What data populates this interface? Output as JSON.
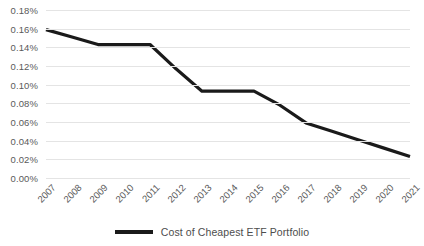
{
  "chart_data": {
    "type": "line",
    "title": "",
    "xlabel": "",
    "ylabel": "",
    "grid": true,
    "legend_position": "bottom",
    "categories": [
      "2007",
      "2008",
      "2009",
      "2010",
      "2011",
      "2012",
      "2013",
      "2014",
      "2015",
      "2016",
      "2017",
      "2018",
      "2019",
      "2020",
      "2021"
    ],
    "ylim": [
      0.0,
      0.18
    ],
    "ytick_labels": [
      "0.18%",
      "0.16%",
      "0.14%",
      "0.12%",
      "0.10%",
      "0.08%",
      "0.06%",
      "0.04%",
      "0.02%",
      "0.00%"
    ],
    "ytick_values": [
      0.18,
      0.16,
      0.14,
      0.12,
      0.1,
      0.08,
      0.06,
      0.04,
      0.02,
      0.0
    ],
    "series": [
      {
        "name": "Cost of Cheapest ETF Portfolio",
        "color": "#1a1a1a",
        "values": [
          0.159,
          0.151,
          0.143,
          0.143,
          0.143,
          0.117,
          0.093,
          0.093,
          0.093,
          0.078,
          0.059,
          0.05,
          0.041,
          0.032,
          0.023
        ]
      }
    ]
  },
  "legend": {
    "entries": [
      {
        "label": "Cost of Cheapest ETF Portfolio",
        "color": "#1a1a1a"
      }
    ]
  },
  "colors": {
    "series": "#1a1a1a",
    "gridline": "#e4e4e4",
    "tick_text": "#5a5a5a",
    "legend_text": "#4d4d4d",
    "background": "#ffffff"
  }
}
